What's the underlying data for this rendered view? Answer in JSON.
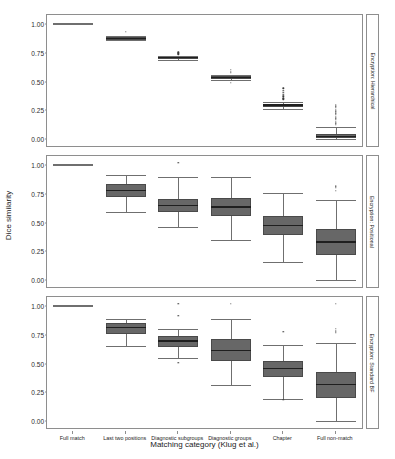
{
  "chart_data": {
    "type": "box",
    "title": "",
    "xlabel": "Matching category (Klug et al.)",
    "ylabel": "Dice similarity",
    "ylim": [
      0.0,
      1.0
    ],
    "yticks": [
      "0.00",
      "0.25",
      "0.50",
      "0.75",
      "1.00"
    ],
    "ytick_values": [
      0.0,
      0.25,
      0.5,
      0.75,
      1.0
    ],
    "grid": false,
    "legend": "none",
    "categories": [
      "Full match",
      "Last two positions",
      "Diagnostic subgroups",
      "Diagnostic groups",
      "Chapter",
      "Full non-match"
    ],
    "panels": [
      {
        "label": "Encryption: Hierarchical",
        "boxes": [
          {
            "category": "Full match",
            "min": 1.0,
            "q1": 1.0,
            "median": 1.0,
            "q3": 1.0,
            "max": 1.0,
            "outliers": []
          },
          {
            "category": "Last two positions",
            "min": 0.86,
            "q1": 0.865,
            "median": 0.875,
            "q3": 0.885,
            "max": 0.9,
            "outliers": [
              0.93
            ]
          },
          {
            "category": "Diagnostic subgroups",
            "min": 0.69,
            "q1": 0.705,
            "median": 0.71,
            "q3": 0.715,
            "max": 0.725,
            "outliers": [
              0.755,
              0.745,
              0.735
            ]
          },
          {
            "category": "Diagnostic groups",
            "min": 0.515,
            "q1": 0.525,
            "median": 0.535,
            "q3": 0.545,
            "max": 0.555,
            "outliers": [
              0.6,
              0.585,
              0.575,
              0.49
            ]
          },
          {
            "category": "Chapter",
            "min": 0.265,
            "q1": 0.28,
            "median": 0.295,
            "q3": 0.305,
            "max": 0.325,
            "outliers": [
              0.44,
              0.42,
              0.4,
              0.385,
              0.37,
              0.355,
              0.345
            ]
          },
          {
            "category": "Full non-match",
            "min": 0.0,
            "q1": 0.005,
            "median": 0.02,
            "q3": 0.045,
            "max": 0.105,
            "outliers": [
              0.3,
              0.285,
              0.27,
              0.255,
              0.24,
              0.225,
              0.21,
              0.195,
              0.18,
              0.165,
              0.15,
              0.135,
              0.125
            ]
          }
        ]
      },
      {
        "label": "Encryption: Positional",
        "boxes": [
          {
            "category": "Full match",
            "min": 1.0,
            "q1": 1.0,
            "median": 1.0,
            "q3": 1.0,
            "max": 1.0,
            "outliers": []
          },
          {
            "category": "Last two positions",
            "min": 0.59,
            "q1": 0.725,
            "median": 0.775,
            "q3": 0.835,
            "max": 0.915,
            "outliers": []
          },
          {
            "category": "Diagnostic subgroups",
            "min": 0.46,
            "q1": 0.595,
            "median": 0.645,
            "q3": 0.705,
            "max": 0.9,
            "outliers": [
              1.02
            ]
          },
          {
            "category": "Diagnostic groups",
            "min": 0.345,
            "q1": 0.555,
            "median": 0.635,
            "q3": 0.715,
            "max": 0.9,
            "outliers": []
          },
          {
            "category": "Chapter",
            "min": 0.155,
            "q1": 0.395,
            "median": 0.475,
            "q3": 0.555,
            "max": 0.76,
            "outliers": []
          },
          {
            "category": "Full non-match",
            "min": 0.0,
            "q1": 0.215,
            "median": 0.33,
            "q3": 0.445,
            "max": 0.7,
            "outliers": [
              0.815,
              0.8,
              0.775
            ]
          }
        ]
      },
      {
        "label": "Encryption: Standard BF",
        "boxes": [
          {
            "category": "Full match",
            "min": 1.0,
            "q1": 1.0,
            "median": 1.0,
            "q3": 1.0,
            "max": 1.0,
            "outliers": []
          },
          {
            "category": "Last two positions",
            "min": 0.655,
            "q1": 0.755,
            "median": 0.815,
            "q3": 0.855,
            "max": 0.885,
            "outliers": []
          },
          {
            "category": "Diagnostic subgroups",
            "min": 0.545,
            "q1": 0.645,
            "median": 0.695,
            "q3": 0.735,
            "max": 0.8,
            "outliers": [
              1.02,
              0.915,
              0.505
            ]
          },
          {
            "category": "Diagnostic groups",
            "min": 0.315,
            "q1": 0.525,
            "median": 0.615,
            "q3": 0.715,
            "max": 0.885,
            "outliers": [
              1.02
            ]
          },
          {
            "category": "Chapter",
            "min": 0.195,
            "q1": 0.385,
            "median": 0.455,
            "q3": 0.525,
            "max": 0.66,
            "outliers": [
              0.775,
              0.185
            ]
          },
          {
            "category": "Full non-match",
            "min": 0.0,
            "q1": 0.2,
            "median": 0.315,
            "q3": 0.425,
            "max": 0.675,
            "outliers": [
              1.02,
              0.8,
              0.785,
              0.775,
              0.765
            ]
          }
        ]
      }
    ]
  }
}
